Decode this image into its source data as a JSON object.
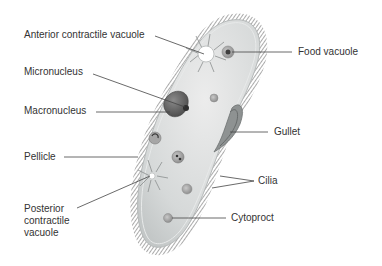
{
  "colors": {
    "body_fill": "#d9dcdc",
    "body_edge": "#bfc3c3",
    "cilia": "#555555",
    "leader_line": "#444444",
    "label_text": "#333333",
    "nucleus": "#6a6a6a",
    "vacuole_center": "#ffffff"
  },
  "labels": {
    "anterior_contractile_vacuole": "Anterior contractile vacuole",
    "micronucleus": "Micronucleus",
    "macronucleus": "Macronucleus",
    "pellicle": "Pellicle",
    "posterior_contractile_vacuole": "Posterior contractile vacuole",
    "food_vacuole": "Food vacuole",
    "gullet": "Gullet",
    "cilia": "Cilia",
    "cytoproct": "Cytoproct"
  }
}
